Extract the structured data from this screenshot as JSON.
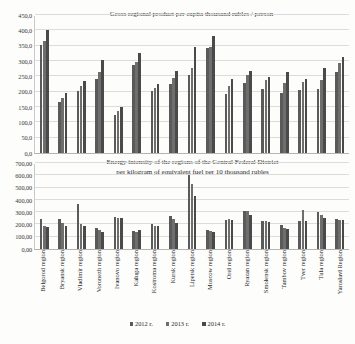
{
  "legend": {
    "items": [
      {
        "label": "2012 г.",
        "color": "#5a5a5a"
      },
      {
        "label": "2013 г.",
        "color": "#6e6e6e"
      },
      {
        "label": "2014 г.",
        "color": "#4a4a4a"
      }
    ]
  },
  "categories": [
    "Belgorod region",
    "Bryansk region",
    "Vladimir region",
    "Voronezh region",
    "Ivanovo region",
    "Kaluga region",
    "Kostroma region",
    "Kursk region",
    "Lipetsk region",
    "Moscow region",
    "Orel region",
    "Ryazan region",
    "Smolensk region",
    "Tambov region",
    "Tver region",
    "Tula region",
    "Yaroslavl Region"
  ],
  "chart_data": [
    {
      "type": "bar",
      "title": "Gross regional product per capita thousand rubles / person",
      "xlabel": "",
      "ylabel": "",
      "ylim": [
        0,
        450
      ],
      "ytick_step": 50,
      "grid": true,
      "legend_position": "bottom",
      "yticks": [
        "0,0",
        "50,0",
        "100,0",
        "150,0",
        "200,0",
        "250,0",
        "300,0",
        "350,0",
        "400,0",
        "450,0"
      ],
      "categories": [
        "Belgorod region",
        "Bryansk region",
        "Vladimir region",
        "Voronezh region",
        "Ivanovo region",
        "Kaluga region",
        "Kostroma region",
        "Kursk region",
        "Lipetsk region",
        "Moscow region",
        "Orel region",
        "Ryazan region",
        "Smolensk region",
        "Tambov region",
        "Tver region",
        "Tula region",
        "Yaroslavl Region"
      ],
      "series": [
        {
          "name": "2012 г.",
          "values": [
            352,
            167,
            201,
            242,
            125,
            288,
            201,
            225,
            255,
            341,
            192,
            227,
            210,
            196,
            205,
            209,
            265
          ]
        },
        {
          "name": "2013 г.",
          "values": [
            366,
            178,
            218,
            263,
            136,
            298,
            213,
            245,
            276,
            347,
            218,
            254,
            238,
            227,
            233,
            237,
            295
          ]
        },
        {
          "name": "2014 г.",
          "values": [
            400,
            195,
            235,
            304,
            149,
            325,
            226,
            269,
            346,
            381,
            241,
            268,
            249,
            265,
            242,
            278,
            312
          ]
        }
      ]
    },
    {
      "type": "bar",
      "title_line1": "Energy intensity of the regions of the Central Federal District",
      "title_line2": "per kilogram of equivalent fuel per 10 thousand rubles",
      "xlabel": "",
      "ylabel": "",
      "ylim": [
        0,
        700
      ],
      "ytick_step": 100,
      "grid": true,
      "legend_position": "bottom",
      "yticks": [
        "0,00",
        "100,00",
        "200,00",
        "300,00",
        "400,00",
        "500,00",
        "600,00",
        "700,00"
      ],
      "categories": [
        "Belgorod region",
        "Bryansk region",
        "Vladimir region",
        "Voronezh region",
        "Ivanovo region",
        "Kaluga region",
        "Kostroma region",
        "Kursk region",
        "Lipetsk region",
        "Moscow region",
        "Orel region",
        "Ryazan region",
        "Smolensk region",
        "Tambov region",
        "Tver region",
        "Tula region",
        "Yaroslavl Region"
      ],
      "series": [
        {
          "name": "2012 г.",
          "values": [
            243,
            244,
            366,
            168,
            260,
            143,
            200,
            269,
            601,
            153,
            240,
            308,
            229,
            196,
            231,
            300,
            247
          ]
        },
        {
          "name": "2013 г.",
          "values": [
            185,
            215,
            206,
            158,
            253,
            140,
            190,
            243,
            533,
            146,
            244,
            310,
            224,
            175,
            315,
            274,
            240
          ]
        },
        {
          "name": "2014 г.",
          "values": [
            176,
            189,
            189,
            135,
            249,
            157,
            186,
            214,
            434,
            140,
            239,
            280,
            221,
            161,
            232,
            254,
            235
          ]
        }
      ]
    }
  ]
}
